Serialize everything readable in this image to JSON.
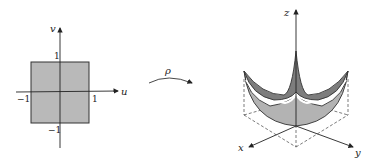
{
  "domain_square": {
    "axis_u_label": "u",
    "axis_v_label": "v",
    "tick_pos_u": "1",
    "tick_neg_u": "−1",
    "tick_pos_v": "1",
    "tick_neg_v": "−1",
    "fill_color": "#b9b9b9"
  },
  "mapping": {
    "label": "ρ"
  },
  "surface": {
    "axis_x_label": "x",
    "axis_y_label": "y",
    "axis_z_label": "z",
    "top_color": "#7d7d7d",
    "bottom_color": "#b3b3b3"
  }
}
